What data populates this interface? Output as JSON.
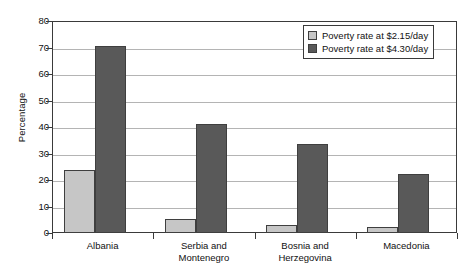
{
  "chart_data": {
    "type": "bar",
    "title": "",
    "xlabel": "",
    "ylabel": "Percentage",
    "ylim": [
      0,
      80
    ],
    "yticks": [
      0,
      10,
      20,
      30,
      40,
      50,
      60,
      70,
      80
    ],
    "ytick_labels": [
      "0",
      "10",
      "20",
      "30",
      "40",
      "50",
      "60",
      "70",
      "80"
    ],
    "grid": true,
    "legend_position": "top-right",
    "categories": [
      "Albania",
      "Serbia and Montenegro",
      "Bosnia and Herzegovina",
      "Macedonia"
    ],
    "category_lines": [
      [
        "Albania"
      ],
      [
        "Serbia and",
        "Montenegro"
      ],
      [
        "Bosnia and",
        "Herzegovina"
      ],
      [
        "Macedonia"
      ]
    ],
    "series": [
      {
        "name": "Poverty rate at $2.15/day",
        "color": "#c6c6c6",
        "values": [
          23.7,
          5.3,
          2.9,
          2.4
        ]
      },
      {
        "name": "Poverty rate at $4.30/day",
        "color": "#595959",
        "values": [
          70.5,
          41.0,
          33.5,
          22.2
        ]
      }
    ]
  },
  "legend": {
    "items": [
      {
        "label": "Poverty rate at $2.15/day"
      },
      {
        "label": "Poverty rate at $4.30/day"
      }
    ]
  }
}
